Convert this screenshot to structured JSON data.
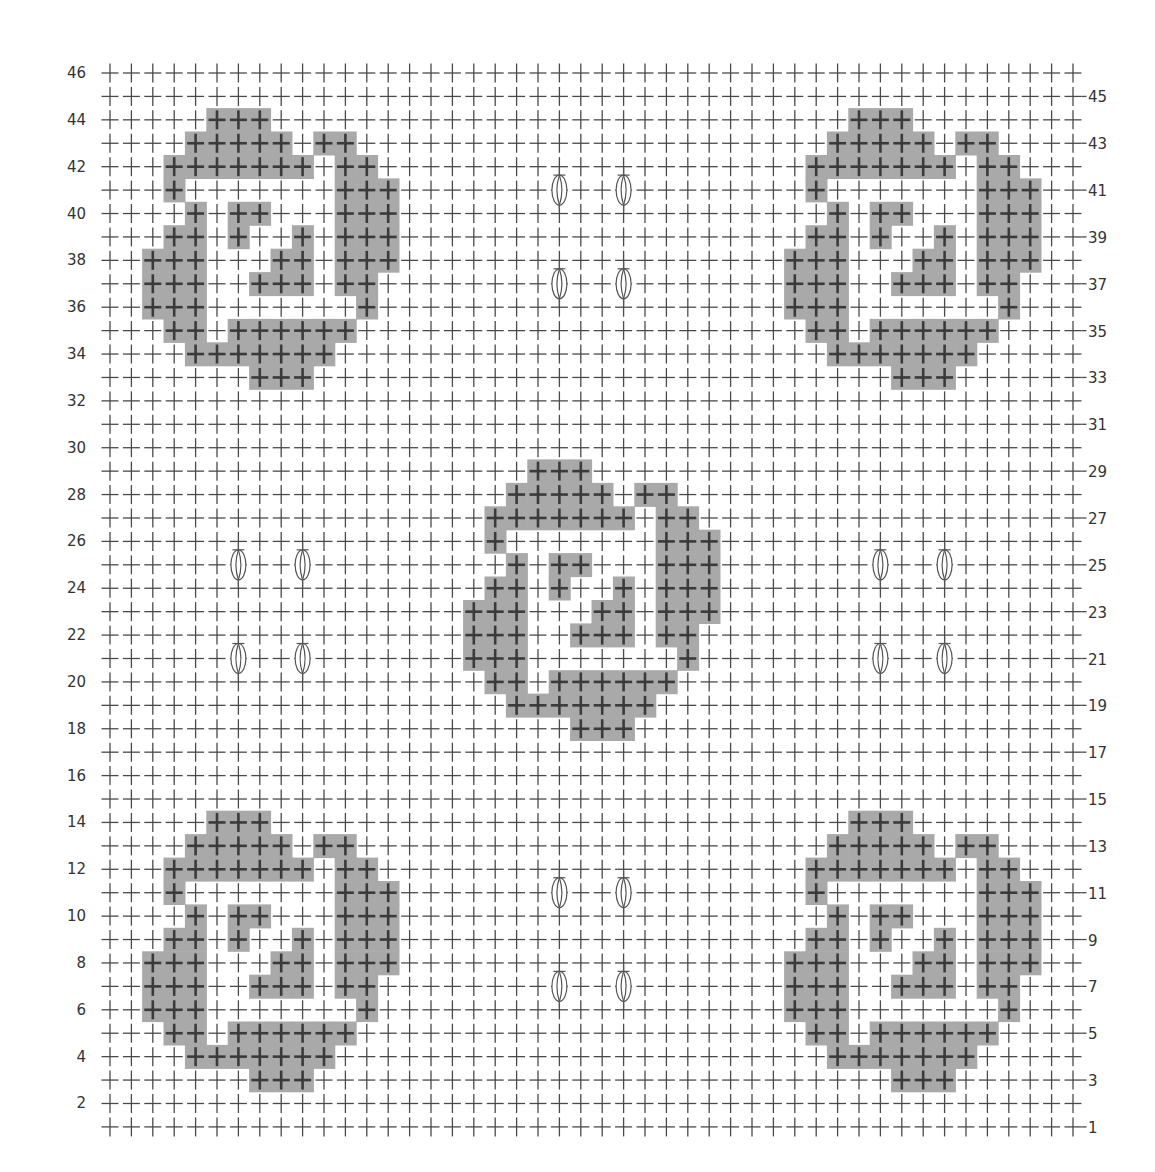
{
  "chart": {
    "type": "crochet-stitch-chart",
    "columns": 46,
    "rows": 46,
    "left_labels": [
      46,
      44,
      42,
      40,
      38,
      36,
      34,
      32,
      30,
      28,
      26,
      24,
      22,
      20,
      18,
      16,
      14,
      12,
      10,
      8,
      6,
      4,
      2
    ],
    "right_labels": [
      45,
      43,
      41,
      39,
      37,
      35,
      33,
      31,
      29,
      27,
      25,
      23,
      21,
      19,
      17,
      15,
      13,
      11,
      9,
      7,
      5,
      3,
      1
    ],
    "legend_symbols": {
      "cross": "single-crochet-stitch",
      "shaded_cell": "contrast-color-stitch",
      "oval": "bobble-stitch"
    },
    "colors": {
      "background": "#ffffff",
      "cross": "#4a4a4a",
      "cross_on_shade": "#3a3a3a",
      "shade": "#a9a9a9",
      "label": "#333333"
    },
    "motif": {
      "description": "shaded square-spiral motif",
      "rows": [
        [
          3,
          4,
          5
        ],
        [
          2,
          3,
          4,
          5,
          6,
          8,
          9
        ],
        [
          1,
          2,
          3,
          4,
          5,
          6,
          7,
          9,
          10
        ],
        [
          1,
          9,
          10,
          11
        ],
        [
          2,
          4,
          5,
          9,
          10,
          11
        ],
        [
          1,
          2,
          4,
          7,
          9,
          10,
          11
        ],
        [
          0,
          1,
          2,
          6,
          7,
          9,
          10,
          11
        ],
        [
          0,
          1,
          2,
          5,
          6,
          7,
          9,
          10
        ],
        [
          0,
          1,
          2,
          10
        ],
        [
          1,
          2,
          4,
          5,
          6,
          7,
          8,
          9
        ],
        [
          2,
          3,
          4,
          5,
          6,
          7,
          8
        ],
        [
          5,
          6,
          7
        ]
      ]
    },
    "motif_placements": [
      {
        "name": "top-left",
        "col": 2,
        "top_row": 44
      },
      {
        "name": "top-right",
        "col": 32,
        "top_row": 44
      },
      {
        "name": "center",
        "col": 17,
        "top_row": 29
      },
      {
        "name": "bottom-left",
        "col": 2,
        "top_row": 14
      },
      {
        "name": "bottom-right",
        "col": 32,
        "top_row": 14
      }
    ],
    "bobbles": [
      [
        21,
        41
      ],
      [
        24,
        41
      ],
      [
        21,
        37
      ],
      [
        24,
        37
      ],
      [
        6,
        25
      ],
      [
        9,
        25
      ],
      [
        6,
        21
      ],
      [
        9,
        21
      ],
      [
        36,
        25
      ],
      [
        39,
        25
      ],
      [
        36,
        21
      ],
      [
        39,
        21
      ],
      [
        21,
        11
      ],
      [
        24,
        11
      ],
      [
        21,
        7
      ],
      [
        24,
        7
      ]
    ]
  }
}
